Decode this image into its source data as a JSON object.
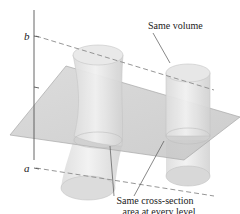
{
  "figure": {
    "axis_labels": {
      "upper": "b",
      "lower": "a"
    },
    "annotations": {
      "volume": "Same volume",
      "cross_section_line1": "Same cross-section",
      "cross_section_line2": "area at every level"
    },
    "colors": {
      "solid_fill": "#e4e4e4",
      "solid_edge": "#b8b8b8",
      "plane_fill": "#cfcfcf",
      "plane_edge": "#a8a8a8",
      "axis": "#555555",
      "dashed": "#8a8a8a",
      "leader": "#555555"
    }
  }
}
